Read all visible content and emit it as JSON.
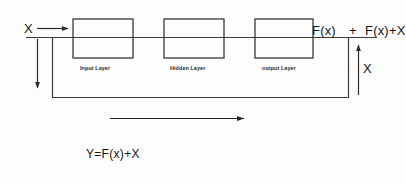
{
  "diagram": {
    "background_color": "#fdfdfd",
    "stroke_color": "#333333",
    "text_color": "#161616",
    "blocks": [
      {
        "label": "Input Layer",
        "x": 73,
        "y": 19,
        "w": 60,
        "h": 39
      },
      {
        "label": "Hidden Layer",
        "x": 164,
        "y": 19,
        "w": 60,
        "h": 39
      },
      {
        "label": "output Layer",
        "x": 255,
        "y": 19,
        "w": 58,
        "h": 39
      }
    ],
    "labels": {
      "input_x": "X",
      "block_output": "F(x)",
      "plus": "+",
      "sum_output": "F(x)+X",
      "skip_x": "X",
      "equation": "Y=F(x)+X"
    },
    "arrows": {
      "input_arrow": "arrow-right",
      "skip_down_arrow": "arrow-down",
      "skip_up_arrow": "arrow-up",
      "flow_direction_arrow": "arrow-right"
    }
  }
}
